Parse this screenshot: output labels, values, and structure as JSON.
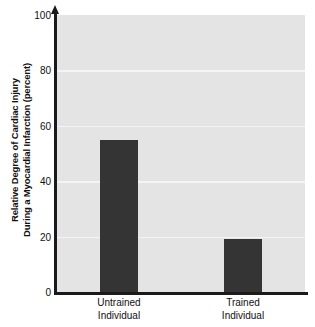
{
  "chart_data": {
    "type": "bar",
    "title": "",
    "subtitle": "",
    "xlabel": "",
    "ylabel": "Relative Degree of Cardiac Injury During a Myocardial Infarction (percent)",
    "ylabel_line1": "Relative Degree of Cardiac Injury",
    "ylabel_line2": "During a Myocardial Infarction (percent)",
    "categories": [
      "Untrained Individual",
      "Trained Individual"
    ],
    "category_lines": [
      {
        "line1": "Untrained",
        "line2": "Individual"
      },
      {
        "line1": "Trained",
        "line2": "Individual"
      }
    ],
    "values": [
      55,
      19
    ],
    "ylim": [
      0,
      100
    ],
    "yticks": [
      0,
      20,
      40,
      60,
      80,
      100
    ],
    "ytick_labels": [
      "0",
      "20",
      "40",
      "60",
      "80",
      "100"
    ],
    "grid": true,
    "grid_axis": "y",
    "legend": false,
    "legend_position": "none",
    "annotations": [],
    "colors": {
      "bar": "#343434",
      "plot_background": "#e4e4e4",
      "gridline": "#f4f4f4",
      "axis": "#1a1a1a",
      "text": "#111111",
      "page_background": "#ffffff"
    }
  }
}
